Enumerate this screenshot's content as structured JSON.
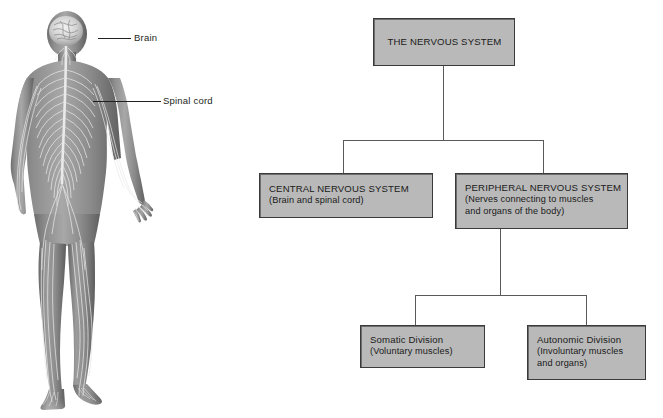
{
  "illustration": {
    "alt_name": "human-nervous-system-figure",
    "labels": [
      {
        "id": "brain",
        "text": "Brain"
      },
      {
        "id": "spinal-cord",
        "text": "Spinal cord"
      }
    ]
  },
  "flowchart": {
    "colors": {
      "node_fill": "#b9b9b9",
      "node_border": "#3a3a3a",
      "connector": "#5a5a5a",
      "text": "#1a1a1a",
      "background": "#ffffff"
    },
    "nodes": [
      {
        "id": "nervous-system",
        "title": "THE NERVOUS SYSTEM",
        "sub": ""
      },
      {
        "id": "central-nervous-system",
        "title": "CENTRAL NERVOUS SYSTEM",
        "sub": "(Brain and spinal cord)"
      },
      {
        "id": "peripheral-nervous-system",
        "title": "PERIPHERAL NERVOUS SYSTEM",
        "sub_line1": "(Nerves connecting to muscles",
        "sub_line2": "and organs of the body)"
      },
      {
        "id": "somatic-division",
        "title": "Somatic Division",
        "sub": "(Voluntary muscles)"
      },
      {
        "id": "autonomic-division",
        "title": "Autonomic Division",
        "sub_line1": "(Involuntary muscles",
        "sub_line2": "and organs)"
      }
    ]
  }
}
